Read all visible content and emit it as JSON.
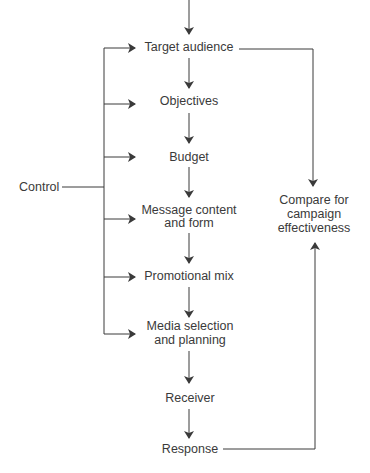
{
  "diagram": {
    "type": "flowchart",
    "nodes": {
      "target_audience": "Target audience",
      "objectives": "Objectives",
      "budget": "Budget",
      "message_line1": "Message content",
      "message_line2": "and form",
      "promotional_mix": "Promotional mix",
      "media_line1": "Media selection",
      "media_line2": "and planning",
      "receiver": "Receiver",
      "response": "Response",
      "control": "Control",
      "compare_line1": "Compare for",
      "compare_line2": "campaign",
      "compare_line3": "effectiveness"
    },
    "edges": [
      [
        "start",
        "Target audience"
      ],
      [
        "Target audience",
        "Objectives"
      ],
      [
        "Objectives",
        "Budget"
      ],
      [
        "Budget",
        "Message content and form"
      ],
      [
        "Message content and form",
        "Promotional mix"
      ],
      [
        "Promotional mix",
        "Media selection and planning"
      ],
      [
        "Media selection and planning",
        "Receiver"
      ],
      [
        "Receiver",
        "Response"
      ],
      [
        "Control",
        "Target audience"
      ],
      [
        "Control",
        "Objectives"
      ],
      [
        "Control",
        "Budget"
      ],
      [
        "Control",
        "Message content and form"
      ],
      [
        "Control",
        "Promotional mix"
      ],
      [
        "Control",
        "Media selection and planning"
      ],
      [
        "Target audience",
        "Compare for campaign effectiveness"
      ],
      [
        "Response",
        "Compare for campaign effectiveness"
      ]
    ],
    "line_color": "#3a3a3a"
  }
}
